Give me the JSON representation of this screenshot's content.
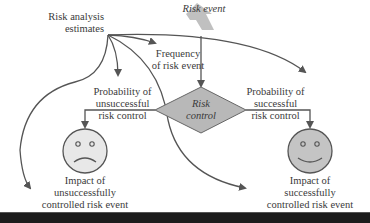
{
  "diagram": {
    "nodes": {
      "risk_analysis": {
        "line1": "Risk analysis",
        "line2": "estimates"
      },
      "risk_event": {
        "label": "Risk event"
      },
      "frequency": {
        "line1": "Frequency",
        "line2": "of risk event"
      },
      "risk_control": {
        "line1": "Risk",
        "line2": "control"
      },
      "prob_unsuccessful": {
        "line1": "Probability of",
        "line2": "unsuccessful",
        "line3": "risk control"
      },
      "prob_successful": {
        "line1": "Probability of",
        "line2": "successful",
        "line3": "risk control"
      },
      "impact_unsuccessful": {
        "line1": "Impact of",
        "line2": "unsuccessfully",
        "line3": "controlled risk event"
      },
      "impact_successful": {
        "line1": "Impact of",
        "line2": "successfully",
        "line3": "controlled risk event"
      }
    },
    "icons": {
      "sad_face": "sad-face-icon",
      "happy_face": "happy-face-icon"
    },
    "colors": {
      "line": "#555555",
      "diamond_fill": "#b8b8b8",
      "face_fill_sad": "#e8e8e8",
      "face_fill_happy": "#c4c4c4",
      "risk_event_shape": "#b5b5b5",
      "bottom_bar": "#1c1c1c"
    }
  }
}
